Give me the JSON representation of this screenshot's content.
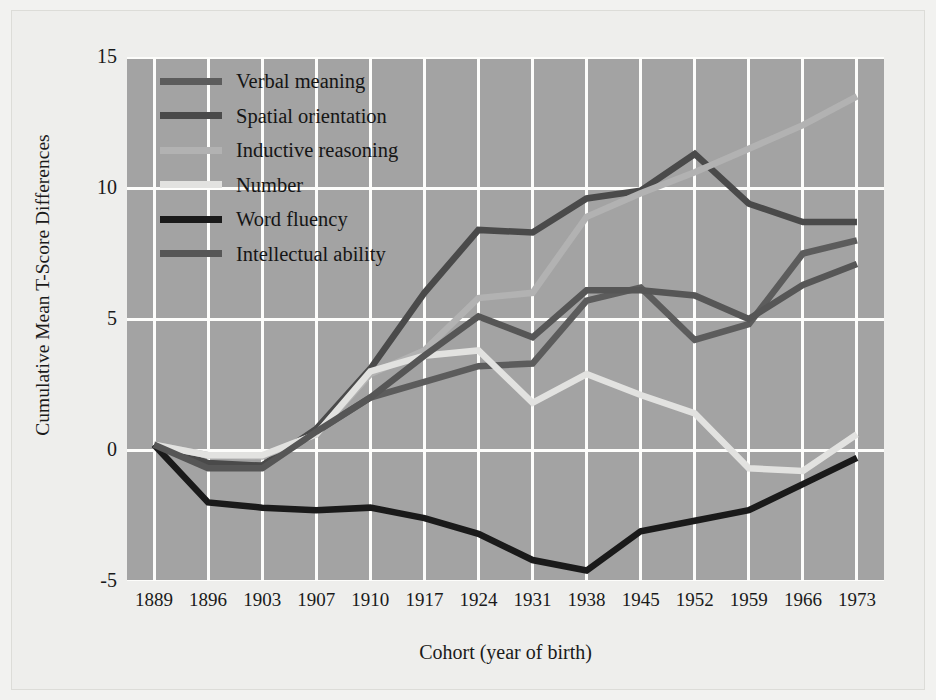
{
  "chart_data": {
    "type": "line",
    "title": "",
    "xlabel": "Cohort (year of birth)",
    "ylabel": "Cumulative Mean T-Score Differences",
    "categories": [
      "1889",
      "1896",
      "1903",
      "1907",
      "1910",
      "1917",
      "1924",
      "1931",
      "1938",
      "1945",
      "1952",
      "1959",
      "1966",
      "1973"
    ],
    "xticklabels": [
      "1889",
      "1896",
      "1903",
      "1907",
      "1910",
      "1917",
      "1924",
      "1931",
      "1938",
      "1945",
      "1952",
      "1959",
      "1966",
      "1973"
    ],
    "yticklabels": [
      "15",
      "10",
      "5",
      "0",
      "-5"
    ],
    "ytickvalues": [
      15,
      10,
      5,
      0,
      -5
    ],
    "ylim": [
      -5,
      15
    ],
    "grid": "both",
    "legend_position": "top-left",
    "series": [
      {
        "name": "Verbal meaning",
        "color": "#5c5c5c",
        "values": [
          0.2,
          -0.6,
          -0.6,
          0.7,
          2.0,
          2.6,
          3.2,
          3.3,
          5.7,
          6.2,
          4.2,
          4.8,
          7.5,
          8.0
        ]
      },
      {
        "name": "Spatial orientation",
        "color": "#4a4a4a",
        "values": [
          0.2,
          -0.5,
          -0.6,
          0.8,
          3.1,
          6.0,
          8.4,
          8.3,
          9.6,
          9.9,
          11.3,
          9.4,
          8.7,
          8.7
        ]
      },
      {
        "name": "Inductive reasoning",
        "color": "#b2b2b2",
        "values": [
          0.2,
          -0.2,
          -0.25,
          0.6,
          2.9,
          3.8,
          5.8,
          6.0,
          8.9,
          9.8,
          10.6,
          11.5,
          12.4,
          13.5
        ]
      },
      {
        "name": "Number",
        "color": "#e2e2e0",
        "values": [
          0.2,
          -0.2,
          -0.2,
          0.6,
          3.0,
          3.6,
          3.8,
          1.8,
          2.9,
          2.1,
          1.4,
          -0.7,
          -0.8,
          0.6
        ]
      },
      {
        "name": "Word fluency",
        "color": "#1a1a1a",
        "values": [
          0.2,
          -2.0,
          -2.2,
          -2.3,
          -2.2,
          -2.6,
          -3.2,
          -4.2,
          -4.6,
          -3.1,
          -2.7,
          -2.3,
          -1.3,
          -0.3
        ]
      },
      {
        "name": "Intellectual ability",
        "color": "#565656",
        "values": [
          0.2,
          -0.7,
          -0.7,
          0.7,
          2.0,
          3.6,
          5.1,
          4.3,
          6.1,
          6.1,
          5.9,
          5.0,
          6.3,
          7.1
        ]
      }
    ]
  },
  "legend": {
    "items": [
      {
        "label": "Verbal meaning"
      },
      {
        "label": "Spatial orientation"
      },
      {
        "label": "Inductive reasoning"
      },
      {
        "label": "Number"
      },
      {
        "label": "Word fluency"
      },
      {
        "label": "Intellectual ability"
      }
    ]
  },
  "colors": {
    "plot_background": "#a3a3a3",
    "figure_background": "#eeeeec",
    "gridline": "#fdfdfb",
    "text": "#1a1a1a"
  }
}
